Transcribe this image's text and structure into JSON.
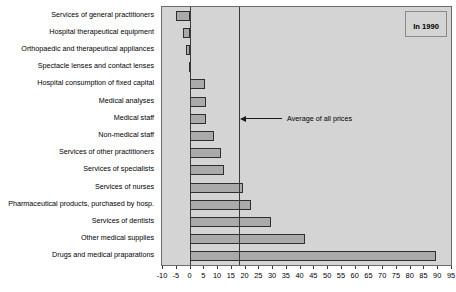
{
  "chart_data": {
    "type": "bar",
    "orientation": "horizontal",
    "title": "",
    "xlabel": "",
    "ylabel": "",
    "xlim": [
      -10,
      95
    ],
    "grid": false,
    "legend_position": "top-right",
    "legend": [
      "In 1990"
    ],
    "annotations": [
      {
        "label": "Average  of all prices",
        "value": 18,
        "style": "arrow-line"
      }
    ],
    "categories": [
      "Services of general practitioners",
      "Hospital therapeutical equipment",
      "Orthopaedic and therapeutical appliances",
      "Spectacle lenses and contact lenses",
      "Hospital consumption of fixed capital",
      "Medical  analyses",
      "Medical staff",
      "Non-medical staff",
      "Services of other practitioners",
      "Services of specialists",
      "Services of nurses",
      "Pharmaceutical products, purchased by hosp.",
      "Services of dentists",
      "Other medical supplies",
      "Drugs and medical praparations"
    ],
    "values": [
      -5.0,
      -2.5,
      -1.2,
      -0.2,
      5.5,
      6.0,
      6.0,
      9.0,
      11.5,
      12.5,
      19.5,
      22.5,
      29.5,
      42.0,
      89.5
    ],
    "xticks": [
      -10,
      -5,
      0,
      5,
      10,
      15,
      20,
      25,
      30,
      35,
      40,
      45,
      50,
      55,
      60,
      65,
      70,
      75,
      80,
      85,
      90,
      95
    ],
    "xtick_labels": [
      "-10",
      "-5",
      "0",
      "5",
      "10",
      "15",
      "20",
      "25",
      "30",
      "35",
      "40",
      "45",
      "50",
      "55",
      "60",
      "65",
      "70",
      "75",
      "80",
      "85",
      "90",
      "95"
    ],
    "colors": {
      "bar_fill": "#aaaaaa",
      "bar_edge": "#2e2e2e",
      "plot_background": "#d4d4d4",
      "axis": "#3a3a3a",
      "text": "#000000"
    }
  }
}
